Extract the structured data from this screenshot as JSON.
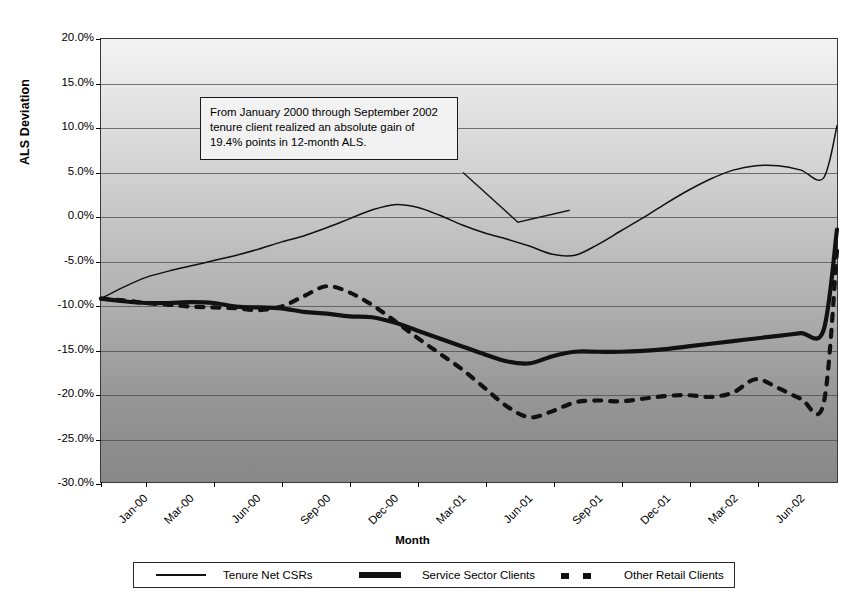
{
  "chart_data": {
    "type": "line",
    "title": "",
    "xlabel": "Month",
    "ylabel": "ALS Deviation",
    "grid": true,
    "legend_position": "bottom",
    "ylim": [
      -30,
      20
    ],
    "ytick_step": 5,
    "ytick_labels": [
      "20.0%",
      "15.0%",
      "10.0%",
      "5.0%",
      "0.0%",
      "-5.0%",
      "-10.0%",
      "-15.0%",
      "-20.0%",
      "-25.0%",
      "-30.0%"
    ],
    "ytick_values": [
      20,
      15,
      10,
      5,
      0,
      -5,
      -10,
      -15,
      -20,
      -25,
      -30
    ],
    "xtick_labels": [
      "Jan-00",
      "Mar-00",
      "Jun-00",
      "Sep-00",
      "Dec-00",
      "Mar-01",
      "Jun-01",
      "Sep-01",
      "Dec-01",
      "Mar-02",
      "Jun-02"
    ],
    "xtick_months": [
      0,
      2,
      5,
      8,
      11,
      14,
      17,
      20,
      23,
      26,
      29
    ],
    "x_months": [
      0,
      1,
      2,
      3,
      4,
      5,
      6,
      7,
      8,
      9,
      10,
      11,
      12,
      13,
      14,
      15,
      16,
      17,
      18,
      19,
      20,
      21,
      22,
      23,
      24,
      25,
      26,
      27,
      28,
      29,
      30,
      31,
      32
    ],
    "series": [
      {
        "name": "Tenure Net CSRs",
        "style": "thin-solid",
        "color": "#111111",
        "values": [
          -9.3,
          -8.0,
          -6.9,
          -6.2,
          -5.6,
          -5.0,
          -4.4,
          -3.7,
          -2.9,
          -2.2,
          -1.3,
          -0.3,
          0.7,
          1.3,
          1.0,
          0.1,
          -1.0,
          -1.9,
          -2.6,
          -3.4,
          -4.3,
          -4.4,
          -3.2,
          -1.7,
          -0.2,
          1.4,
          2.9,
          4.2,
          5.2,
          5.7,
          5.7,
          5.2,
          4.3
        ]
      },
      {
        "name": "Service Sector Clients",
        "style": "thick-solid",
        "color": "#111111",
        "values": [
          -9.3,
          -9.6,
          -9.8,
          -9.8,
          -9.7,
          -9.8,
          -10.2,
          -10.3,
          -10.4,
          -10.8,
          -11.0,
          -11.3,
          -11.4,
          -12.0,
          -12.9,
          -13.8,
          -14.7,
          -15.6,
          -16.4,
          -16.6,
          -15.8,
          -15.3,
          -15.3,
          -15.3,
          -15.2,
          -15.0,
          -14.7,
          -14.4,
          -14.1,
          -13.8,
          -13.5,
          -13.2,
          -12.9
        ]
      },
      {
        "name": "Other Retail Clients",
        "style": "dashed",
        "color": "#111111",
        "values": [
          -9.3,
          -9.5,
          -9.8,
          -10.0,
          -10.2,
          -10.3,
          -10.4,
          -10.6,
          -10.2,
          -9.0,
          -7.9,
          -8.6,
          -10.0,
          -11.8,
          -13.7,
          -15.5,
          -17.3,
          -19.4,
          -21.5,
          -22.7,
          -22.0,
          -21.0,
          -20.8,
          -20.9,
          -20.6,
          -20.3,
          -20.2,
          -20.4,
          -19.9,
          -18.4,
          -19.4,
          -20.6,
          -21.2
        ]
      }
    ],
    "series_tail": {
      "note": "values continue to right edge of plot",
      "Tenure Net CSRs_end": 10.2,
      "Service Sector Clients_end": -1.5,
      "Other Retail Clients_end": -3.9
    },
    "annotation": {
      "text": "From January 2000 through September 2002 tenure client realized an absolute gain of 19.4% points in 12-month ALS.",
      "leader_to_series": "Tenure Net CSRs"
    }
  },
  "legend": {
    "items": [
      {
        "label": "Tenure Net CSRs",
        "key": "thin-line-key"
      },
      {
        "label": "Service Sector Clients",
        "key": "thick-line-key"
      },
      {
        "label": "Other Retail Clients",
        "key": "dashed-line-key"
      }
    ]
  },
  "axes": {
    "y_title": "ALS Deviation",
    "x_title": "Month"
  }
}
